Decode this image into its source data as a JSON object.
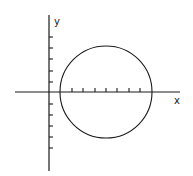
{
  "diagram": {
    "type": "coordinate-plane-circle",
    "axes": {
      "x_label": "x",
      "y_label": "y",
      "origin_px": [
        49,
        92
      ],
      "x_axis_px": [
        15,
        180
      ],
      "y_axis_px": [
        15,
        171
      ]
    },
    "ticks": {
      "y_axis_px": [
        37,
        48,
        59,
        71,
        82,
        104,
        115,
        126,
        137,
        148
      ],
      "x_axis_px": [
        72,
        83,
        95,
        106,
        117,
        129,
        140
      ]
    },
    "circle": {
      "center_px": [
        106,
        92
      ],
      "radius_px": 46
    },
    "colors": {
      "stroke": "#1a1a1a",
      "background": "#ffffff"
    }
  }
}
